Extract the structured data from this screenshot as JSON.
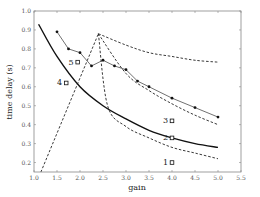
{
  "chart_data": {
    "type": "line",
    "title": "",
    "xlabel": "gain",
    "ylabel": "time delay (s)",
    "xlim": [
      1.0,
      5.5
    ],
    "ylim": [
      0.15,
      1.0
    ],
    "xticks": [
      "1.0",
      "1.5",
      "2.0",
      "2.5",
      "3.0",
      "3.5",
      "4.0",
      "4.5",
      "5.0",
      "5.5"
    ],
    "yticks": [
      "0.2",
      "0.3",
      "0.4",
      "0.5",
      "0.6",
      "0.7",
      "0.8",
      "0.9",
      "1.0"
    ],
    "grid": false,
    "legend": null,
    "series": [
      {
        "name": "measured (circle markers)",
        "style": "solid-thin-with-dots",
        "x": [
          1.5,
          1.75,
          2.0,
          2.25,
          2.5,
          2.75,
          3.0,
          3.25,
          3.5,
          4.0,
          4.5,
          5.0
        ],
        "y": [
          0.89,
          0.8,
          0.78,
          0.71,
          0.74,
          0.71,
          0.69,
          0.63,
          0.6,
          0.54,
          0.49,
          0.44
        ]
      },
      {
        "name": "solid curve",
        "style": "solid-thick",
        "x": [
          1.1,
          1.5,
          2.0,
          2.5,
          3.0,
          3.5,
          4.0,
          4.5,
          5.0
        ],
        "y": [
          0.93,
          0.76,
          0.6,
          0.5,
          0.43,
          0.37,
          0.33,
          0.3,
          0.28
        ]
      },
      {
        "name": "dashed rising",
        "style": "dashed",
        "x": [
          1.15,
          2.4
        ],
        "y": [
          0.15,
          0.88
        ]
      },
      {
        "name": "dashed upper branch",
        "style": "dashed",
        "x": [
          2.4,
          3.0,
          3.5,
          4.0,
          4.5,
          5.0
        ],
        "y": [
          0.88,
          0.82,
          0.78,
          0.76,
          0.74,
          0.73
        ]
      },
      {
        "name": "dashed middle branch",
        "style": "dashed",
        "x": [
          2.4,
          3.0,
          3.5,
          4.0,
          4.5,
          5.0
        ],
        "y": [
          0.88,
          0.67,
          0.58,
          0.51,
          0.45,
          0.4
        ]
      },
      {
        "name": "dashed lower branch",
        "style": "dashed",
        "x": [
          2.4,
          2.6,
          3.0,
          3.5,
          4.0,
          4.5,
          5.0
        ],
        "y": [
          0.88,
          0.5,
          0.39,
          0.33,
          0.28,
          0.25,
          0.22
        ]
      }
    ],
    "annotations": [
      {
        "label": "1",
        "x": 4.0,
        "y": 0.2,
        "marker": "open-square"
      },
      {
        "label": "2",
        "x": 4.0,
        "y": 0.33,
        "marker": "open-square"
      },
      {
        "label": "3",
        "x": 4.0,
        "y": 0.42,
        "marker": "open-square"
      },
      {
        "label": "4",
        "x": 1.7,
        "y": 0.62,
        "marker": "open-square"
      },
      {
        "label": "5",
        "x": 1.95,
        "y": 0.73,
        "marker": "open-square"
      }
    ]
  }
}
